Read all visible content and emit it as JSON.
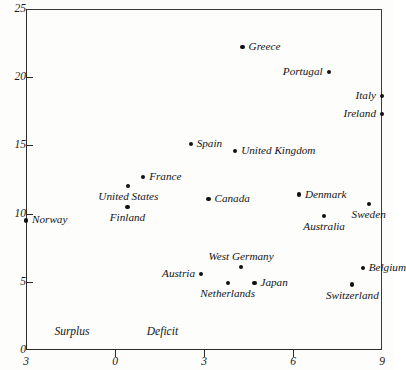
{
  "chart_data": {
    "type": "scatter",
    "title": "",
    "subtitle": "",
    "xlabel": "",
    "ylabel": "",
    "xlim": [
      -3,
      9
    ],
    "ylim": [
      0,
      25
    ],
    "xticks": [
      -3,
      0,
      3,
      6,
      9
    ],
    "xtick_labels": [
      "3",
      "0",
      "3",
      "6",
      "9"
    ],
    "yticks": [
      0,
      5,
      10,
      15,
      20,
      25
    ],
    "ytick_labels": [
      "0",
      "5",
      "10",
      "15",
      "20",
      "25"
    ],
    "grid": false,
    "legend": null,
    "annotations": [
      {
        "text": "Surplus",
        "x": -1.45,
        "y": 1.3
      },
      {
        "text": "Deficit",
        "x": 1.6,
        "y": 1.3
      }
    ],
    "points": [
      {
        "label": "Norway",
        "x": -3.0,
        "y": 9.5,
        "label_pos": "right"
      },
      {
        "label": "United States",
        "x": 0.45,
        "y": 12.0,
        "label_pos": "below"
      },
      {
        "label": "Finland",
        "x": 0.42,
        "y": 10.5,
        "label_pos": "below"
      },
      {
        "label": "France",
        "x": 0.95,
        "y": 12.7,
        "label_pos": "right"
      },
      {
        "label": "Spain",
        "x": 2.55,
        "y": 15.1,
        "label_pos": "right"
      },
      {
        "label": "Canada",
        "x": 3.15,
        "y": 11.1,
        "label_pos": "right"
      },
      {
        "label": "United Kingdom",
        "x": 4.05,
        "y": 14.6,
        "label_pos": "right"
      },
      {
        "label": "Greece",
        "x": 4.3,
        "y": 22.2,
        "label_pos": "right"
      },
      {
        "label": "Denmark",
        "x": 6.2,
        "y": 11.4,
        "label_pos": "right"
      },
      {
        "label": "Australia",
        "x": 7.05,
        "y": 9.8,
        "label_pos": "below"
      },
      {
        "label": "Sweden",
        "x": 8.55,
        "y": 10.7,
        "label_pos": "below"
      },
      {
        "label": "Portugal",
        "x": 7.2,
        "y": 20.4,
        "label_pos": "left"
      },
      {
        "label": "Italy",
        "x": 9.0,
        "y": 18.6,
        "label_pos": "left"
      },
      {
        "label": "Ireland",
        "x": 9.0,
        "y": 17.3,
        "label_pos": "left"
      },
      {
        "label": "Austria",
        "x": 2.9,
        "y": 5.6,
        "label_pos": "left"
      },
      {
        "label": "Netherlands",
        "x": 3.8,
        "y": 4.9,
        "label_pos": "below"
      },
      {
        "label": "West Germany",
        "x": 4.25,
        "y": 6.1,
        "label_pos": "above"
      },
      {
        "label": "Japan",
        "x": 4.7,
        "y": 4.9,
        "label_pos": "right"
      },
      {
        "label": "Switzerland",
        "x": 8.0,
        "y": 4.8,
        "label_pos": "below"
      },
      {
        "label": "Belgium",
        "x": 8.35,
        "y": 6.0,
        "label_pos": "right"
      }
    ]
  }
}
